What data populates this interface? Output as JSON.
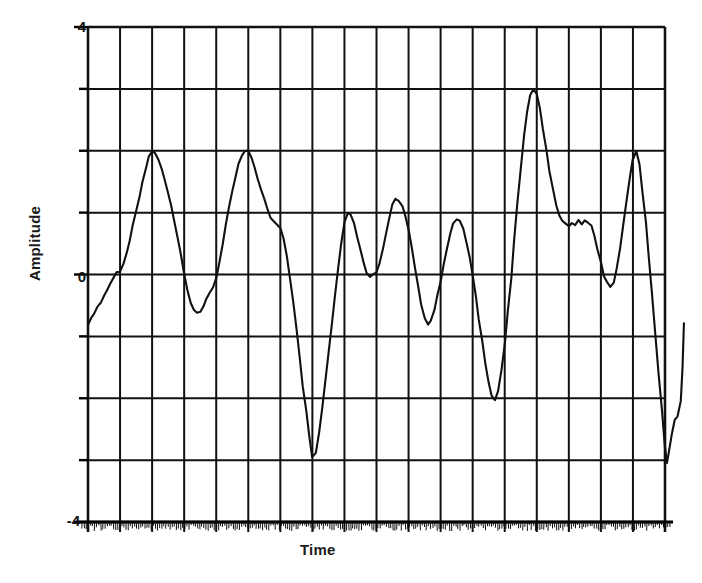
{
  "chart_data": {
    "type": "line",
    "title": "",
    "xlabel": "Time",
    "ylabel": "Amplitude",
    "xlim": [
      0,
      18
    ],
    "ylim": [
      -4,
      4
    ],
    "grid": true,
    "legend": null,
    "y_tick_labels": [
      "4",
      "0",
      "-4"
    ],
    "y_tick_values": [
      4,
      0,
      -4
    ],
    "y_gridline_values": [
      4,
      3,
      2,
      1,
      0,
      -1,
      -2,
      -3,
      -4
    ],
    "x_gridline_count": 19,
    "x_tick_labels": [],
    "series": [
      {
        "name": "signal",
        "color": "#111111",
        "x": [
          0.0,
          0.1,
          0.2,
          0.3,
          0.4,
          0.5,
          0.6,
          0.7,
          0.8,
          0.9,
          1.0,
          1.1,
          1.2,
          1.3,
          1.4,
          1.5,
          1.6,
          1.7,
          1.8,
          1.9,
          2.0,
          2.1,
          2.2,
          2.3,
          2.4,
          2.5,
          2.6,
          2.7,
          2.8,
          2.9,
          3.0,
          3.1,
          3.2,
          3.3,
          3.4,
          3.5,
          3.6,
          3.7,
          3.8,
          3.9,
          4.0,
          4.1,
          4.2,
          4.3,
          4.4,
          4.5,
          4.6,
          4.7,
          4.8,
          4.9,
          5.0,
          5.1,
          5.2,
          5.3,
          5.4,
          5.5,
          5.6,
          5.7,
          5.8,
          5.9,
          6.0,
          6.1,
          6.2,
          6.3,
          6.4,
          6.5,
          6.6,
          6.7,
          6.8,
          6.9,
          7.0,
          7.1,
          7.2,
          7.3,
          7.4,
          7.5,
          7.6,
          7.7,
          7.8,
          7.9,
          8.0,
          8.1,
          8.2,
          8.3,
          8.4,
          8.5,
          8.6,
          8.7,
          8.8,
          8.9,
          9.0,
          9.1,
          9.2,
          9.3,
          9.4,
          9.5,
          9.6,
          9.7,
          9.8,
          9.9,
          10.0,
          10.1,
          10.2,
          10.3,
          10.4,
          10.5,
          10.6,
          10.7,
          10.8,
          10.9,
          11.0,
          11.1,
          11.2,
          11.3,
          11.4,
          11.5,
          11.6,
          11.7,
          11.8,
          11.9,
          12.0,
          12.1,
          12.2,
          12.3,
          12.4,
          12.5,
          12.6,
          12.7,
          12.8,
          12.9,
          13.0,
          13.1,
          13.2,
          13.3,
          13.4,
          13.5,
          13.6,
          13.7,
          13.8,
          13.9,
          14.0,
          14.1,
          14.2,
          14.3,
          14.4,
          14.5,
          14.6,
          14.7,
          14.8,
          14.9,
          15.0,
          15.1,
          15.2,
          15.3,
          15.4,
          15.5,
          15.6,
          15.7,
          15.8,
          15.9,
          16.0,
          16.1,
          16.2,
          16.3,
          16.4,
          16.5,
          16.6,
          16.7,
          16.8,
          16.9,
          17.0,
          17.1,
          17.2,
          17.3,
          17.4,
          17.5,
          17.6,
          17.7,
          17.8,
          17.9,
          18.0
        ],
        "y": [
          -0.8,
          -0.7,
          -0.62,
          -0.53,
          -0.45,
          -0.35,
          -0.25,
          -0.14,
          -0.04,
          0.04,
          0.05,
          0.18,
          0.35,
          0.55,
          0.78,
          1.0,
          1.25,
          1.5,
          1.72,
          1.9,
          2.0,
          1.97,
          1.85,
          1.7,
          1.52,
          1.32,
          1.1,
          0.86,
          0.6,
          0.32,
          0.02,
          -0.25,
          -0.45,
          -0.58,
          -0.62,
          -0.6,
          -0.52,
          -0.4,
          -0.3,
          -0.2,
          -0.05,
          0.2,
          0.48,
          0.78,
          1.08,
          1.35,
          1.58,
          1.78,
          1.92,
          1.99,
          2.0,
          1.88,
          1.72,
          1.55,
          1.38,
          1.22,
          1.05,
          0.92,
          0.85,
          0.8,
          0.76,
          0.58,
          0.3,
          -0.05,
          -0.45,
          -0.9,
          -1.35,
          -1.8,
          -2.2,
          -2.6,
          -2.95,
          -2.88,
          -2.55,
          -2.15,
          -1.7,
          -1.25,
          -0.8,
          -0.35,
          0.1,
          0.5,
          0.85,
          1.0,
          0.96,
          0.82,
          0.62,
          0.4,
          0.18,
          0.02,
          -0.03,
          0.0,
          0.02,
          0.18,
          0.42,
          0.68,
          0.92,
          1.12,
          1.22,
          1.2,
          1.1,
          0.95,
          0.72,
          0.42,
          0.12,
          -0.2,
          -0.48,
          -0.7,
          -0.8,
          -0.75,
          -0.58,
          -0.35,
          -0.1,
          0.18,
          0.44,
          0.66,
          0.82,
          0.9,
          0.86,
          0.74,
          0.55,
          0.3,
          0.0,
          -0.35,
          -0.72,
          -1.1,
          -1.45,
          -1.75,
          -1.95,
          -2.02,
          -1.88,
          -1.55,
          -1.1,
          -0.6,
          -0.05,
          0.55,
          1.15,
          1.72,
          2.25,
          2.65,
          2.9,
          3.0,
          2.92,
          2.68,
          2.35,
          2.0,
          1.68,
          1.38,
          1.12,
          0.95,
          0.86,
          0.82,
          0.78,
          0.84,
          0.8,
          0.88,
          0.82,
          0.88,
          0.84,
          0.8,
          0.62,
          0.4,
          0.18,
          -0.02,
          -0.14,
          -0.2,
          -0.12,
          0.1,
          0.42,
          0.8,
          1.18,
          1.55,
          1.85,
          2.0,
          1.78,
          1.35,
          0.85,
          0.3,
          -0.3,
          -0.95,
          -1.6,
          -2.2,
          -2.75
        ]
      }
    ],
    "annotations": [
      {
        "label": "peak-1",
        "x": 2.0,
        "y": 2.0
      },
      {
        "label": "peak-2",
        "x": 5.0,
        "y": 2.0
      },
      {
        "label": "trough-1",
        "x": 7.0,
        "y": -2.95
      },
      {
        "label": "tall-peak",
        "x": 13.9,
        "y": 3.0
      },
      {
        "label": "plateau",
        "x": 15.4,
        "y": 0.85
      },
      {
        "label": "peak-3",
        "x": 17.1,
        "y": 2.0
      },
      {
        "label": "trough-2",
        "x": 12.7,
        "y": -2.02
      }
    ],
    "tail": {
      "note": "after final plunge the trace steps back up to about -0.8 at the right edge",
      "x": [
        18.0,
        18.05,
        18.1,
        18.2,
        18.3,
        18.4,
        18.5,
        18.55,
        18.6
      ],
      "y": [
        -2.75,
        -3.05,
        -2.95,
        -2.6,
        -2.35,
        -2.3,
        -2.05,
        -1.5,
        -0.8
      ]
    },
    "style": {
      "line_color": "#111111",
      "grid_color": "#111111",
      "axis_color": "#000000",
      "background": "#ffffff",
      "scanned": true
    }
  },
  "axes": {
    "y_title": "Amplitude",
    "x_title": "Time",
    "y_top_label": "4",
    "y_mid_label": "0",
    "y_bottom_label": "-4"
  }
}
